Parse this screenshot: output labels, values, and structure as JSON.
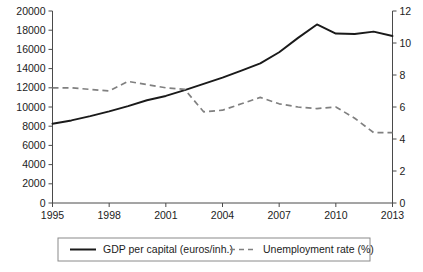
{
  "chart_data": {
    "type": "line",
    "title": "",
    "subtitle": "",
    "xlabel": "",
    "ylabel": "",
    "grid": false,
    "legend_position": "bottom",
    "x": [
      1995,
      1996,
      1997,
      1998,
      1999,
      2000,
      2001,
      2002,
      2003,
      2004,
      2005,
      2006,
      2007,
      2008,
      2009,
      2010,
      2011,
      2012,
      2013
    ],
    "x_tick_labels": [
      "1995",
      "1998",
      "2001",
      "2004",
      "2007",
      "2010",
      "2013"
    ],
    "x_ticks": [
      1995,
      1998,
      2001,
      2004,
      2007,
      2010,
      2013
    ],
    "xlim": [
      1995,
      2013
    ],
    "axes": [
      {
        "id": "left",
        "label": "GDP per capital (euros/inh.)",
        "ylim": [
          0,
          20000
        ],
        "ytick_step": 2000,
        "ytick_labels": [
          "0",
          "2000",
          "4000",
          "6000",
          "8000",
          "10000",
          "12000",
          "14000",
          "16000",
          "18000",
          "20000"
        ],
        "ytick_values": [
          0,
          2000,
          4000,
          6000,
          8000,
          10000,
          12000,
          14000,
          16000,
          18000,
          20000
        ]
      },
      {
        "id": "right",
        "label": "Unemployment rate (%)",
        "ylim": [
          0,
          12
        ],
        "ytick_step": 2,
        "ytick_labels": [
          "0",
          "2",
          "4",
          "6",
          "8",
          "10",
          "12"
        ],
        "ytick_values": [
          0,
          2,
          4,
          6,
          8,
          10,
          12
        ]
      }
    ],
    "series": [
      {
        "name": "GDP per capital (euros/inh.)",
        "axis": "left",
        "style": "solid",
        "color": "#1a1a1a",
        "values": [
          8250,
          8600,
          9050,
          9550,
          10100,
          10700,
          11150,
          11750,
          12400,
          13050,
          13800,
          14550,
          15700,
          17200,
          18600,
          17650,
          17600,
          17850,
          17400
        ]
      },
      {
        "name": "Unemployment rate (%)",
        "axis": "right",
        "style": "dashed",
        "color": "#808080",
        "values": [
          7.2,
          7.2,
          7.1,
          7.0,
          7.6,
          7.4,
          7.2,
          7.1,
          5.7,
          5.8,
          6.2,
          6.6,
          6.2,
          6.0,
          5.9,
          6.0,
          5.3,
          4.4,
          4.4
        ]
      }
    ],
    "unemployment_by_year": {
      "1995": 7.2,
      "1996": 7.2,
      "1997": 7.1,
      "1998": 7.6,
      "1999": 7.3,
      "2000": 7.2,
      "2001": 5.7,
      "2002": 5.8,
      "2003": 6.6,
      "2004": 6.2,
      "2005": 6.0,
      "2006": 5.9,
      "2007": 6.0,
      "2008": 5.3,
      "2009": 4.4,
      "2010": 6.0,
      "2011": 7.7,
      "2012": 8.7,
      "2013": 10.0
    },
    "gdp_by_year": {
      "1995": 8250,
      "1996": 8600,
      "1997": 9050,
      "1998": 9550,
      "1999": 10100,
      "2000": 10700,
      "2001": 11150,
      "2002": 11750,
      "2003": 12400,
      "2004": 13050,
      "2005": 13800,
      "2006": 14550,
      "2007": 15700,
      "2008": 18600,
      "2009": 17650,
      "2010": 17600,
      "2011": 17850,
      "2012": 17550,
      "2013": 17400
    }
  },
  "legend": {
    "items": [
      {
        "label": "GDP per capital (euros/inh.)",
        "style": "solid",
        "color": "#1a1a1a"
      },
      {
        "label": "Unemployment rate (%)",
        "style": "dashed",
        "color": "#808080"
      }
    ]
  },
  "axis_left_ticks": [
    "20000",
    "18000",
    "16000",
    "14000",
    "12000",
    "10000",
    "8000",
    "6000",
    "4000",
    "2000",
    "0"
  ],
  "axis_right_ticks": [
    "12",
    "10",
    "8",
    "6",
    "4",
    "2",
    "0"
  ],
  "axis_x_ticks": [
    "1995",
    "1998",
    "2001",
    "2004",
    "2007",
    "2010",
    "2013"
  ]
}
